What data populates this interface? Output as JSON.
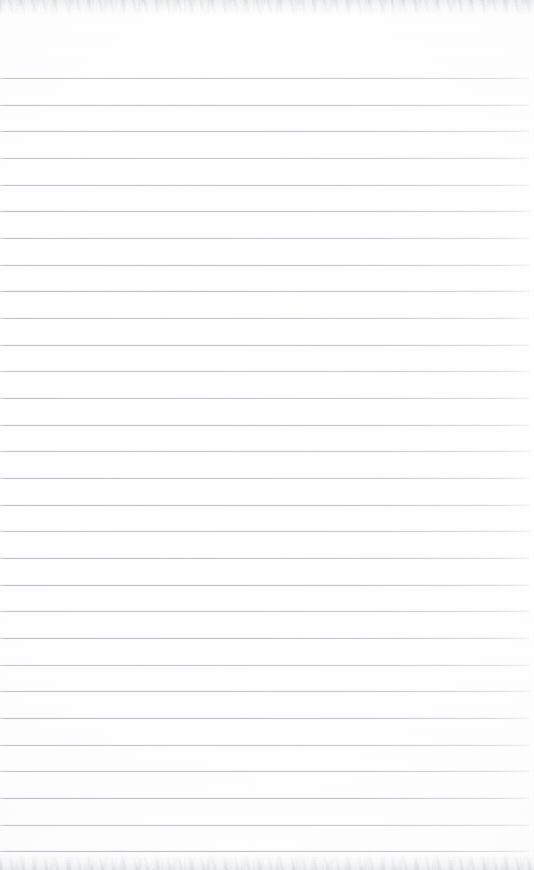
{
  "document": {
    "kind": "scanned-document",
    "subject": "blank ruled notepad page",
    "title": "",
    "page_text": "",
    "handwriting": "",
    "printed_text": "",
    "annotations": []
  },
  "page": {
    "width": 534,
    "height": 870,
    "background_color": "#fdfdfd",
    "orientation": "portrait"
  },
  "ruling": {
    "style": "horizontal-ruled",
    "line_color": "#b6babf",
    "line_thickness_px": 1,
    "line_count": 30,
    "first_line_y": 78,
    "line_spacing_px": 26.67,
    "last_line_y": 851,
    "line_start_x": 0,
    "line_end_x": 530,
    "right_fade": true,
    "margin_rule": "none",
    "vertical_rule": "none"
  },
  "header_margin": {
    "label": "",
    "top": 0,
    "height": 78,
    "content": ""
  },
  "writing_area": {
    "top": 78,
    "height": 773,
    "content": ""
  },
  "scan_artifacts": {
    "top_band": {
      "label": "",
      "top": 0,
      "height": 15,
      "tint": "#b6b9be"
    },
    "bottom_band": {
      "label": "",
      "height": 16,
      "tint": "#b6b9be"
    }
  }
}
